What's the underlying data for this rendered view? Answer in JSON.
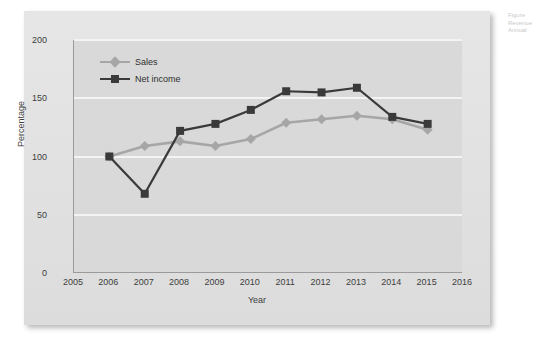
{
  "figure": {
    "caption_lines": [
      "Figure",
      "Revenue",
      "Annual"
    ],
    "panel_color": "#e3e3e3",
    "plot_color": "#d9d9d9",
    "gridline_color": "#f4f4f4"
  },
  "chart_data": {
    "type": "line",
    "title": "",
    "xlabel": "Year",
    "ylabel": "Percentage",
    "x": [
      2006,
      2007,
      2008,
      2009,
      2010,
      2011,
      2012,
      2013,
      2014,
      2015
    ],
    "xticks": [
      "2005",
      "2006",
      "2007",
      "2008",
      "2009",
      "2010",
      "2011",
      "2012",
      "2013",
      "2014",
      "2015",
      "2016"
    ],
    "yticks": [
      "0",
      "50",
      "100",
      "150",
      "200"
    ],
    "xlim": [
      2005,
      2016
    ],
    "ylim": [
      0,
      200
    ],
    "grid": true,
    "legend_position": "upper-left",
    "series": [
      {
        "name": "Sales",
        "color": "#a6a6a6",
        "marker": "diamond",
        "values": [
          100,
          109,
          113,
          109,
          115,
          129,
          132,
          135,
          132,
          123
        ]
      },
      {
        "name": "Net income",
        "color": "#3a3a3a",
        "marker": "square",
        "values": [
          100,
          68,
          122,
          128,
          140,
          156,
          155,
          159,
          134,
          128
        ]
      }
    ]
  }
}
